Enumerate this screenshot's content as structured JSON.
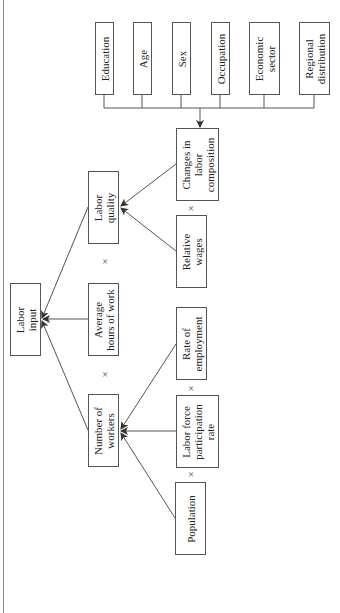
{
  "diagram": {
    "orientation": "rotated-90-ccw",
    "colors": {
      "stroke": "#555555",
      "text": "#222222",
      "background": "#ffffff"
    },
    "nodes": {
      "labor_input": "Labor\ninput",
      "number_of_workers": "Number of\nworkers",
      "average_hours": "Average\nhours of work",
      "labor_quality": "Labor\nquality",
      "population": "Population",
      "lfpr": "Labor force\nparticipation\nrate",
      "rate_of_employment": "Rate of\nemployment",
      "relative_wages": "Relative\nwages",
      "changes_in_composition": "Changes in\nlabor\ncomposition",
      "education": "Education",
      "age": "Age",
      "sex": "Sex",
      "occupation": "Occupation",
      "economic_sector": "Economic\nsector",
      "regional_distribution": "Regional\ndistribution"
    },
    "operators": {
      "workers_x_hours": "×",
      "hours_x_quality": "×",
      "population_x_lfpr": "×",
      "lfpr_x_employment": "×",
      "wages_x_composition": "×"
    },
    "edges": [
      {
        "from": "Number of workers",
        "to": "Labor input"
      },
      {
        "from": "Average hours of work",
        "to": "Labor input"
      },
      {
        "from": "Labor quality",
        "to": "Labor input"
      },
      {
        "from": "Population",
        "to": "Number of workers"
      },
      {
        "from": "Labor force participation rate",
        "to": "Number of workers"
      },
      {
        "from": "Rate of employment",
        "to": "Number of workers"
      },
      {
        "from": "Relative wages",
        "to": "Labor quality"
      },
      {
        "from": "Changes in labor composition",
        "to": "Labor quality"
      },
      {
        "from": "Education, Age, Sex, Occupation, Economic sector, Regional distribution",
        "to": "Changes in labor composition"
      }
    ]
  }
}
